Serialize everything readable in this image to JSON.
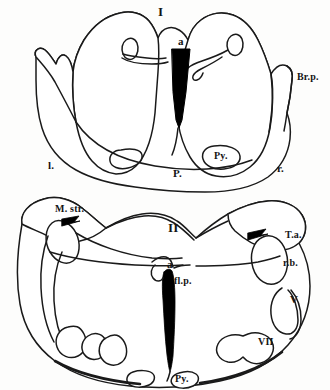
{
  "figure": {
    "ink_color": "#1a1a1a",
    "fill_color": "#ffffff",
    "background_color": "#fdfdfc",
    "solid_black": "#000000"
  },
  "sections": [
    {
      "id": "section-one",
      "numeral": "I",
      "description": "upper pontine transverse section",
      "labels": [
        {
          "name": "aqueduct",
          "text": "a"
        },
        {
          "name": "brachium-pontis",
          "text": "Br.p."
        },
        {
          "name": "pyramid",
          "text": "Py."
        },
        {
          "name": "pons",
          "text": "P."
        },
        {
          "name": "left-side",
          "text": "l."
        },
        {
          "name": "right-side",
          "text": "r."
        }
      ]
    },
    {
      "id": "section-two",
      "numeral": "II",
      "description": "lower pontine / facial colliculus transverse section",
      "labels": [
        {
          "name": "medullary-striae",
          "text": "M. str."
        },
        {
          "name": "aqueduct",
          "text": "a"
        },
        {
          "name": "fasciculus-longitudinalis-posterior",
          "text": "fl.p."
        },
        {
          "name": "tuberculum-acusticum",
          "text": "T.a."
        },
        {
          "name": "restiform-body",
          "text": "r.b."
        },
        {
          "name": "trigeminal-nerve",
          "text": "V"
        },
        {
          "name": "facial-nerve",
          "text": "VII"
        },
        {
          "name": "pyramid",
          "text": "Py."
        }
      ]
    }
  ],
  "all_labels": {
    "numeral_one": "I",
    "numeral_two": "II",
    "aqueduct_one": "a",
    "aqueduct_two": "a",
    "brachium_pontis": "Br.p.",
    "pyramid_one": "Py.",
    "pyramid_two": "Py.",
    "pons": "P.",
    "left": "l.",
    "right": "r.",
    "medullary_striae": "M. str.",
    "fasc_long_post": "fl.p.",
    "tuberculum_acusticum": "T.a.",
    "restiform_body": "r.b.",
    "nerve_v": "V",
    "nerve_vii": "VII"
  }
}
